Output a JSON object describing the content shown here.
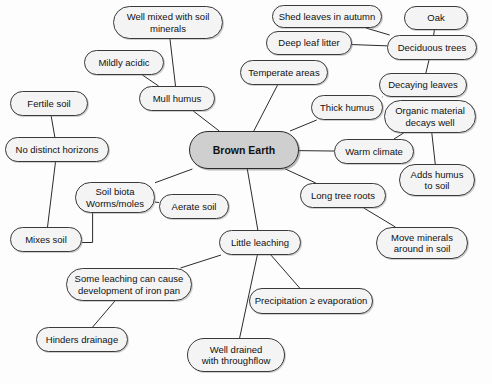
{
  "diagram": {
    "type": "mind-map",
    "title": "Brown Earth",
    "central_node": {
      "id": "brown-earth",
      "label": "Brown Earth",
      "x": 189,
      "y": 131,
      "w": 110,
      "h": 38,
      "fill": "#cfcfcf",
      "bold": true
    },
    "node_fill": "#f4f4f4",
    "node_stroke": "#3a3a3a",
    "edge_color": "#2b2b2b",
    "nodes": [
      {
        "id": "well-mixed",
        "label": "Well mixed with soil\nminerals",
        "x": 113,
        "y": 6,
        "w": 110,
        "h": 33
      },
      {
        "id": "mildly-acidic",
        "label": "Mildly acidic",
        "x": 84,
        "y": 50,
        "w": 80,
        "h": 25
      },
      {
        "id": "mull-humus",
        "label": "Mull humus",
        "x": 139,
        "y": 86,
        "w": 76,
        "h": 25
      },
      {
        "id": "fertile-soil",
        "label": "Fertile soil",
        "x": 10,
        "y": 91,
        "w": 78,
        "h": 25
      },
      {
        "id": "no-distinct",
        "label": "No distinct horizons",
        "x": 5,
        "y": 137,
        "w": 104,
        "h": 25
      },
      {
        "id": "mixes-soil",
        "label": "Mixes soil",
        "x": 10,
        "y": 227,
        "w": 72,
        "h": 25
      },
      {
        "id": "soil-biota",
        "label": "Soil biota\nWorms/moles",
        "x": 75,
        "y": 182,
        "w": 80,
        "h": 31
      },
      {
        "id": "aerate-soil",
        "label": "Aerate soil",
        "x": 159,
        "y": 194,
        "w": 70,
        "h": 25
      },
      {
        "id": "temperate-areas",
        "label": "Temperate areas",
        "x": 240,
        "y": 60,
        "w": 88,
        "h": 25
      },
      {
        "id": "thick-humus",
        "label": "Thick humus",
        "x": 311,
        "y": 95,
        "w": 72,
        "h": 25
      },
      {
        "id": "shed-leaves",
        "label": "Shed leaves in autumn",
        "x": 272,
        "y": 5,
        "w": 110,
        "h": 23
      },
      {
        "id": "deep-leaf-litter",
        "label": "Deep leaf litter",
        "x": 266,
        "y": 31,
        "w": 86,
        "h": 24
      },
      {
        "id": "oak",
        "label": "Oak",
        "x": 404,
        "y": 6,
        "w": 64,
        "h": 24
      },
      {
        "id": "deciduous-trees",
        "label": "Deciduous trees",
        "x": 387,
        "y": 35,
        "w": 90,
        "h": 25
      },
      {
        "id": "decaying-leaves",
        "label": "Decaying leaves",
        "x": 379,
        "y": 73,
        "w": 88,
        "h": 24
      },
      {
        "id": "organic-material",
        "label": "Organic material\ndecays well",
        "x": 384,
        "y": 100,
        "w": 92,
        "h": 33
      },
      {
        "id": "warm-climate",
        "label": "Warm climate",
        "x": 334,
        "y": 139,
        "w": 80,
        "h": 25
      },
      {
        "id": "adds-humus",
        "label": "Adds humus\nto soil",
        "x": 399,
        "y": 164,
        "w": 76,
        "h": 32
      },
      {
        "id": "long-tree-roots",
        "label": "Long tree roots",
        "x": 300,
        "y": 183,
        "w": 86,
        "h": 25
      },
      {
        "id": "move-minerals",
        "label": "Move minerals\naround in soil",
        "x": 376,
        "y": 227,
        "w": 92,
        "h": 32
      },
      {
        "id": "little-leaching",
        "label": "Little leaching",
        "x": 219,
        "y": 230,
        "w": 82,
        "h": 25
      },
      {
        "id": "some-leaching",
        "label": "Some leaching can cause\ndevelopment of iron pan",
        "x": 66,
        "y": 268,
        "w": 126,
        "h": 33
      },
      {
        "id": "hinders-drainage",
        "label": "Hinders drainage",
        "x": 36,
        "y": 327,
        "w": 92,
        "h": 25
      },
      {
        "id": "precipitation",
        "label": "Precipitation ≥ evaporation",
        "x": 249,
        "y": 288,
        "w": 124,
        "h": 26
      },
      {
        "id": "well-drained",
        "label": "Well drained\nwith throughflow",
        "x": 187,
        "y": 338,
        "w": 98,
        "h": 34
      }
    ],
    "edges": [
      {
        "from": "brown-earth",
        "to": "mull-humus",
        "kind": "line"
      },
      {
        "from": "mull-humus",
        "to": "well-mixed",
        "kind": "line"
      },
      {
        "from": "mull-humus",
        "to": "mildly-acidic",
        "kind": "line"
      },
      {
        "from": "brown-earth",
        "to": "temperate-areas",
        "kind": "line"
      },
      {
        "from": "brown-earth",
        "to": "thick-humus",
        "kind": "line"
      },
      {
        "from": "thick-humus",
        "to": "decaying-leaves",
        "kind": "line"
      },
      {
        "from": "decaying-leaves",
        "to": "deciduous-trees",
        "kind": "line"
      },
      {
        "from": "deciduous-trees",
        "to": "oak",
        "kind": "line"
      },
      {
        "from": "deciduous-trees",
        "to": "shed-leaves",
        "kind": "line"
      },
      {
        "from": "deciduous-trees",
        "to": "deep-leaf-litter",
        "kind": "line"
      },
      {
        "from": "brown-earth",
        "to": "warm-climate",
        "kind": "line"
      },
      {
        "from": "warm-climate",
        "to": "organic-material",
        "kind": "line"
      },
      {
        "from": "organic-material",
        "to": "adds-humus",
        "kind": "line"
      },
      {
        "from": "brown-earth",
        "to": "long-tree-roots",
        "kind": "line"
      },
      {
        "from": "long-tree-roots",
        "to": "move-minerals",
        "kind": "line"
      },
      {
        "from": "brown-earth",
        "to": "little-leaching",
        "kind": "line"
      },
      {
        "from": "little-leaching",
        "to": "precipitation",
        "kind": "line"
      },
      {
        "from": "little-leaching",
        "to": "well-drained",
        "kind": "line"
      },
      {
        "from": "little-leaching",
        "to": "some-leaching",
        "kind": "line"
      },
      {
        "from": "some-leaching",
        "to": "hinders-drainage",
        "kind": "line"
      },
      {
        "from": "brown-earth",
        "to": "soil-biota",
        "kind": "line"
      },
      {
        "from": "soil-biota",
        "to": "aerate-soil",
        "kind": "line"
      },
      {
        "from": "soil-biota",
        "to": "mixes-soil",
        "kind": "elbow"
      },
      {
        "from": "fertile-soil",
        "to": "no-distinct",
        "kind": "line"
      },
      {
        "from": "no-distinct",
        "to": "mixes-soil",
        "kind": "line"
      }
    ]
  }
}
